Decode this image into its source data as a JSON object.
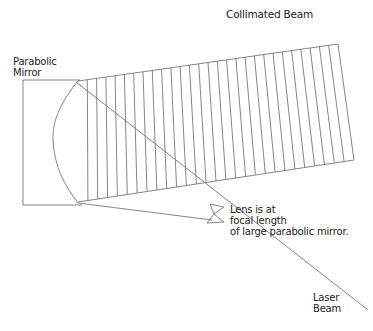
{
  "labels": {
    "collimated_beam": "Collimated Beam",
    "parabolic_mirror": [
      "Parabolic",
      "Mirror"
    ],
    "lens_note": [
      "Lens is at",
      "focal length",
      "of large parabolic mirror."
    ],
    "laser_beam": [
      "Laser",
      "Beam"
    ]
  },
  "colors": {
    "line": "#777777",
    "text": "#222222",
    "background": "#ffffff"
  },
  "geometry": {
    "beam": {
      "top_left": [
        78,
        81
      ],
      "top_right": [
        338,
        44
      ],
      "bottom_right": [
        354,
        160
      ],
      "bottom_left": [
        78,
        202
      ],
      "hatch_count": 28
    },
    "mirror": {
      "back_x": 23,
      "top_y": 80,
      "bottom_y": 205
    },
    "lens": {
      "center": [
        216,
        214
      ]
    },
    "laser_end": [
      368,
      310
    ]
  }
}
